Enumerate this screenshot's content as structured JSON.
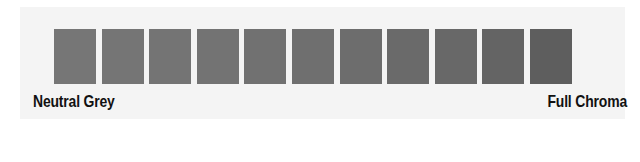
{
  "scale": {
    "left_label": "Neutral Grey",
    "right_label": "Full Chroma",
    "swatches": [
      {
        "color": "#767676"
      },
      {
        "color": "#757575"
      },
      {
        "color": "#747474"
      },
      {
        "color": "#737373"
      },
      {
        "color": "#717171"
      },
      {
        "color": "#6f6f6f"
      },
      {
        "color": "#6d6d6d"
      },
      {
        "color": "#6a6a6a"
      },
      {
        "color": "#686868"
      },
      {
        "color": "#646464"
      },
      {
        "color": "#5e5e5e"
      }
    ]
  }
}
